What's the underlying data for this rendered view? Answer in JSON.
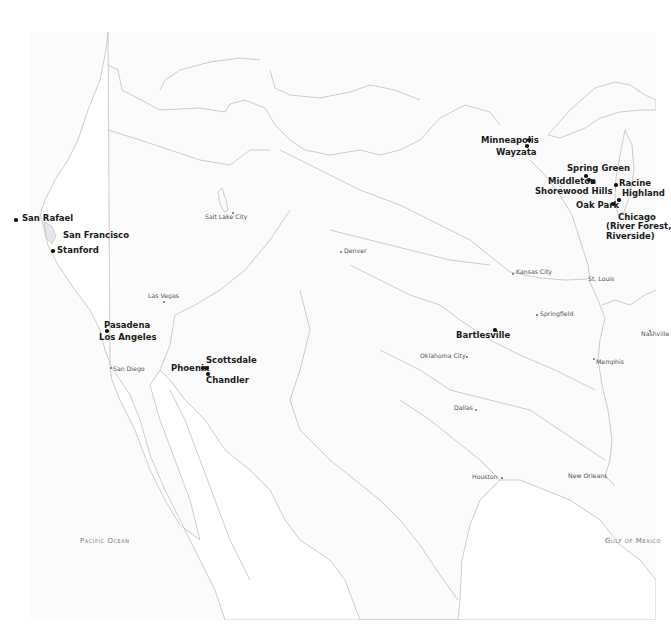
{
  "map": {
    "region": "Western and Central United States",
    "line_color": "#b8b8b8",
    "water_color": "#fbfbfb",
    "land_color": "#ffffff",
    "water_labels": [
      {
        "name": "Pacific Ocean",
        "x": 80,
        "y": 538
      },
      {
        "name": "Gulf of Mexico",
        "x": 605,
        "y": 538
      }
    ],
    "featured_places": [
      {
        "name": "San Rafael",
        "x": 22,
        "y": 216,
        "dot_x": 16,
        "dot_y": 220
      },
      {
        "name": "San Francisco",
        "x": 63,
        "y": 233
      },
      {
        "name": "Stanford",
        "x": 57,
        "y": 248,
        "dot_x": 52,
        "dot_y": 251
      },
      {
        "name": "Pasadena",
        "x": 104,
        "y": 322
      },
      {
        "name": "Los Angeles",
        "x": 99,
        "y": 334,
        "dot_x": 106,
        "dot_y": 330
      },
      {
        "name": "Scottsdale",
        "x": 206,
        "y": 357
      },
      {
        "name": "Phoenix",
        "x": 171,
        "y": 365,
        "dot_x": 202,
        "dot_y": 368
      },
      {
        "name": "Chandler",
        "x": 206,
        "y": 376,
        "dot_x": 207,
        "dot_y": 373
      },
      {
        "name": "Minneapolis",
        "x": 481,
        "y": 137,
        "dot_x": 528,
        "dot_y": 139
      },
      {
        "name": "Wayzata",
        "x": 496,
        "y": 149,
        "dot_x": 526,
        "dot_y": 145
      },
      {
        "name": "Spring Green",
        "x": 567,
        "y": 165,
        "dot_x": 585,
        "dot_y": 175
      },
      {
        "name": "Middleton",
        "x": 548,
        "y": 178,
        "dot_x": 588,
        "dot_y": 179
      },
      {
        "name": "Shorewood Hills",
        "x": 535,
        "y": 187,
        "dot_x": 592,
        "dot_y": 181
      },
      {
        "name": "Racine",
        "x": 619,
        "y": 180,
        "dot_x": 615,
        "dot_y": 184
      },
      {
        "name": "Highland",
        "x": 622,
        "y": 190,
        "dot_x": 618,
        "dot_y": 199
      },
      {
        "name": "Oak Park",
        "x": 576,
        "y": 202,
        "dot_x": 612,
        "dot_y": 203
      },
      {
        "name": "Chicago (River Forest, Riverside)",
        "lines": [
          "Chicago",
          "(River Forest,",
          "Riverside)"
        ],
        "x": 588,
        "y": 213
      },
      {
        "name": "Bartlesville",
        "x": 456,
        "y": 332,
        "dot_x": 494,
        "dot_y": 329
      }
    ],
    "reference_cities": [
      {
        "name": "Salt Lake City",
        "x": 205,
        "y": 214,
        "dot_x": 232,
        "dot_y": 212,
        "label_side": "left"
      },
      {
        "name": "Denver",
        "x": 343,
        "y": 248,
        "dot_x": 340,
        "dot_y": 251,
        "label_side": "right"
      },
      {
        "name": "Las Vegas",
        "x": 148,
        "y": 293,
        "dot_x": 163,
        "dot_y": 301,
        "label_side": "top"
      },
      {
        "name": "San Diego",
        "x": 112,
        "y": 366,
        "dot_x": 110,
        "dot_y": 368,
        "label_side": "right"
      },
      {
        "name": "Kansas City",
        "x": 514,
        "y": 269,
        "dot_x": 512,
        "dot_y": 273,
        "label_side": "right"
      },
      {
        "name": "St. Louis",
        "x": 588,
        "y": 276,
        "dot_x": 584,
        "dot_y": 279,
        "label_side": "right"
      },
      {
        "name": "Springfield",
        "x": 539,
        "y": 311,
        "dot_x": 536,
        "dot_y": 314,
        "label_side": "right"
      },
      {
        "name": "Oklahoma City",
        "x": 420,
        "y": 353,
        "dot_x": 466,
        "dot_y": 356,
        "label_side": "left"
      },
      {
        "name": "Memphis",
        "x": 595,
        "y": 359,
        "dot_x": 593,
        "dot_y": 358,
        "label_side": "right"
      },
      {
        "name": "Nashville",
        "x": 641,
        "y": 331,
        "dot_x": 649,
        "dot_y": 330,
        "label_side": "right"
      },
      {
        "name": "Dallas",
        "x": 454,
        "y": 405,
        "dot_x": 475,
        "dot_y": 409,
        "label_side": "left"
      },
      {
        "name": "Houston",
        "x": 472,
        "y": 474,
        "dot_x": 501,
        "dot_y": 477,
        "label_side": "left"
      },
      {
        "name": "New Orleans",
        "x": 568,
        "y": 473,
        "dot_x": 605,
        "dot_y": 476,
        "label_side": "left"
      }
    ]
  }
}
